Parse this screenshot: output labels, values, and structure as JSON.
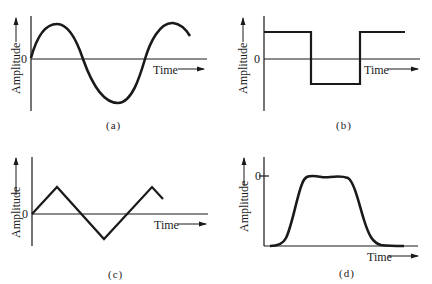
{
  "figure": {
    "panels": [
      {
        "id": "a",
        "caption": "(a)",
        "waveform": "sine",
        "y_label": "Amplitude",
        "x_label": "Time",
        "zero_label": "0"
      },
      {
        "id": "b",
        "caption": "(b)",
        "waveform": "square",
        "y_label": "Amplitude",
        "x_label": "Time",
        "zero_label": "0"
      },
      {
        "id": "c",
        "caption": "(c)",
        "waveform": "triangle",
        "y_label": "Amplitude",
        "x_label": "Time",
        "zero_label": "0"
      },
      {
        "id": "d",
        "caption": "(d)",
        "waveform": "pulse",
        "y_label": "Amplitude",
        "x_label": "Time",
        "zero_label": "0"
      }
    ]
  },
  "colors": {
    "line": "#1a1a1a",
    "background": "#ffffff"
  }
}
